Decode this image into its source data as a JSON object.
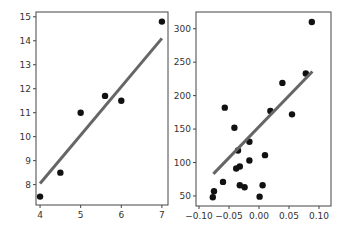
{
  "chart_data": [
    {
      "type": "scatter",
      "title": "",
      "xlabel": "",
      "ylabel": "",
      "xlim": [
        3.9,
        7.15
      ],
      "ylim": [
        7.15,
        15.2
      ],
      "xticks": [
        4,
        5,
        6,
        7
      ],
      "yticks": [
        8,
        9,
        10,
        11,
        12,
        13,
        14,
        15
      ],
      "grid": false,
      "points": {
        "x": [
          4.0,
          4.5,
          5.0,
          5.6,
          6.0,
          7.0
        ],
        "y": [
          7.5,
          8.5,
          11.0,
          11.7,
          11.5,
          14.8
        ]
      },
      "fit_line": {
        "x": [
          4.0,
          7.0
        ],
        "y": [
          8.05,
          14.1
        ]
      },
      "point_color": "#111111",
      "line_color": "#666666"
    },
    {
      "type": "scatter",
      "title": "",
      "xlabel": "",
      "ylabel": "",
      "xlim": [
        -0.105,
        0.12
      ],
      "ylim": [
        35,
        325
      ],
      "xticks": [
        -0.1,
        -0.05,
        0.0,
        0.05,
        0.1
      ],
      "xtick_labels": [
        "−0.10",
        "−0.05",
        "0.00",
        "0.05",
        "0.10"
      ],
      "yticks": [
        50,
        100,
        150,
        200,
        250,
        300
      ],
      "grid": false,
      "points": {
        "x": [
          -0.077,
          -0.075,
          -0.06,
          -0.057,
          -0.041,
          -0.038,
          -0.035,
          -0.032,
          -0.032,
          -0.024,
          -0.016,
          -0.016,
          0.001,
          0.006,
          0.01,
          0.019,
          0.039,
          0.055,
          0.078,
          0.088
        ],
        "y": [
          48,
          57,
          71,
          182,
          152,
          91,
          118,
          94,
          66,
          63,
          103,
          131,
          49,
          66,
          111,
          177,
          219,
          172,
          233,
          310
        ]
      },
      "fit_line": {
        "x": [
          -0.076,
          0.089
        ],
        "y": [
          83,
          236
        ]
      },
      "point_color": "#111111",
      "line_color": "#666666"
    }
  ]
}
